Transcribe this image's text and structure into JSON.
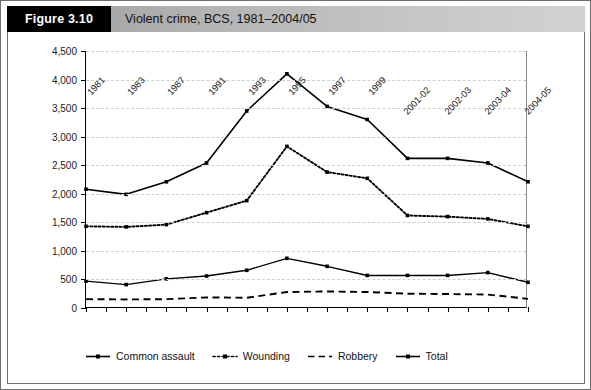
{
  "figure": {
    "tag": "Figure 3.10",
    "title": "Violent crime, BCS, 1981–2004/05"
  },
  "chart_data": {
    "type": "line",
    "title": "Violent crime, BCS, 1981–2004/05",
    "xlabel": "",
    "ylabel": "",
    "ylim": [
      0,
      4500
    ],
    "ytick_labels": [
      "0",
      "500",
      "1,000",
      "1,500",
      "2,000",
      "2,500",
      "3,000",
      "3,500",
      "4,000",
      "4,500"
    ],
    "ytick_values": [
      0,
      500,
      1000,
      1500,
      2000,
      2500,
      3000,
      3500,
      4000,
      4500
    ],
    "grid": true,
    "legend_position": "below-left",
    "categories": [
      "1981",
      "1983",
      "1987",
      "1991",
      "1993",
      "1995",
      "1997",
      "1999",
      "2001-02",
      "2002-03",
      "2003-04",
      "2004-05"
    ],
    "series": [
      {
        "name": "Common assault",
        "style": "solid-marker",
        "values": [
          470,
          410,
          510,
          560,
          660,
          870,
          730,
          570,
          570,
          570,
          620,
          450
        ]
      },
      {
        "name": "Wounding",
        "style": "dotted-marker",
        "values": [
          1430,
          1420,
          1460,
          1670,
          1880,
          2830,
          2380,
          2270,
          1620,
          1600,
          1560,
          1430
        ]
      },
      {
        "name": "Robbery",
        "style": "dashed",
        "values": [
          155,
          150,
          155,
          185,
          180,
          280,
          290,
          280,
          250,
          245,
          235,
          160
        ]
      },
      {
        "name": "Total",
        "style": "solid-marker-bold",
        "values": [
          2080,
          1990,
          2210,
          2540,
          3450,
          4100,
          3530,
          3300,
          2620,
          2620,
          2540,
          2210
        ]
      }
    ]
  },
  "legend": {
    "items": [
      {
        "label": "Common assault",
        "icon": "solid-line-marker-icon"
      },
      {
        "label": "Wounding",
        "icon": "dotted-line-marker-icon"
      },
      {
        "label": "Robbery",
        "icon": "dashed-line-icon"
      },
      {
        "label": "Total",
        "icon": "solid-line-marker-icon"
      }
    ]
  }
}
